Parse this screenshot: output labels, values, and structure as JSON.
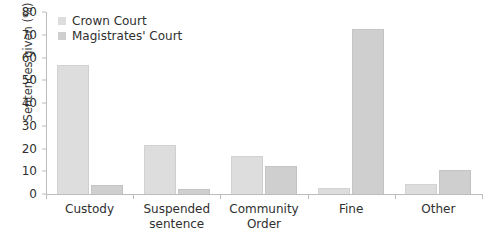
{
  "chart_data": {
    "type": "bar",
    "title": "",
    "xlabel": "",
    "ylabel": "Sentences given (%)",
    "ylim": [
      0,
      80
    ],
    "ytick_step": 10,
    "yticks": [
      "80",
      "70",
      "60",
      "50",
      "40",
      "30",
      "20",
      "10",
      "0"
    ],
    "grid": false,
    "legend_position": "top-left",
    "categories": [
      "Custody",
      "Suspended sentence",
      "Community Order",
      "Fine",
      "Other"
    ],
    "category_lines": [
      [
        "Custody"
      ],
      [
        "Suspended",
        "sentence"
      ],
      [
        "Community",
        "Order"
      ],
      [
        "Fine"
      ],
      [
        "Other"
      ]
    ],
    "series": [
      {
        "name": "Crown Court",
        "color": "#dddddd",
        "values": [
          56.5,
          21.5,
          16.5,
          2.5,
          4.5
        ]
      },
      {
        "name": "Magistrates' Court",
        "color": "#cfcfcf",
        "values": [
          4.0,
          2.0,
          12.5,
          72.5,
          10.5
        ]
      }
    ]
  },
  "legend": {
    "items": [
      {
        "label": "Crown Court",
        "swatch": "crown"
      },
      {
        "label": "Magistrates' Court",
        "swatch": "mags"
      }
    ]
  },
  "axis": {
    "y_title": "Sentences given (%)"
  }
}
